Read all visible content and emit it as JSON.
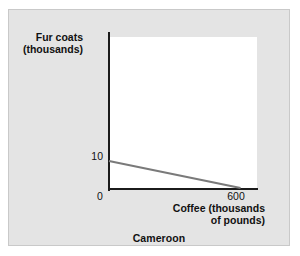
{
  "figure": {
    "caption": "Cameroon",
    "panel_color": "#e4e4e4",
    "plot_background": "#ffffff",
    "axis_color": "#1b1b1b",
    "line_color": "#7a7a7a"
  },
  "chart_data": {
    "type": "line",
    "title": "",
    "subtitle": "Cameroon",
    "xlabel": "Coffee (thousands\nof pounds)",
    "xlabel_line1": "Coffee (thousands",
    "xlabel_line2": "of pounds)",
    "ylabel": "Fur coats\n(thousands)",
    "ylabel_line1": "Fur coats",
    "ylabel_line2": "(thousands)",
    "xlim": [
      0,
      675
    ],
    "ylim": [
      0,
      56
    ],
    "xticks": [
      0,
      600
    ],
    "xtick_labels": [
      "0",
      "600"
    ],
    "yticks": [
      0,
      10
    ],
    "ytick_labels": [
      "",
      "10"
    ],
    "grid": false,
    "legend": null,
    "series": [
      {
        "name": "Production possibilities frontier",
        "color": "#7a7a7a",
        "x": [
          0,
          600
        ],
        "y": [
          10,
          0
        ]
      }
    ],
    "annotations": []
  },
  "ticks": {
    "y_10": "10",
    "x_0": "0",
    "x_600": "600"
  }
}
